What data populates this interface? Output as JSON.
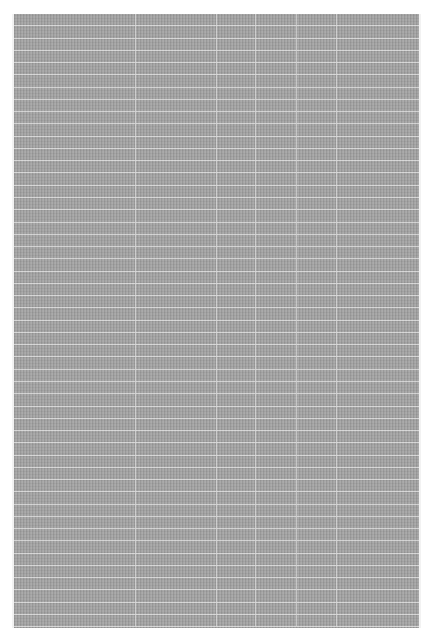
{
  "document": {
    "type": "dense table (text illegible at this resolution)",
    "background_color": "#a6a6a6",
    "gridline_color": "#ffffff",
    "columns": [
      {
        "width": 122,
        "header": ""
      },
      {
        "width": 81,
        "header": ""
      },
      {
        "width": 39,
        "header": ""
      },
      {
        "width": 41,
        "header": ""
      },
      {
        "width": 40,
        "header": ""
      },
      {
        "width": 82,
        "header": ""
      }
    ],
    "row_count": 50,
    "cells": []
  }
}
